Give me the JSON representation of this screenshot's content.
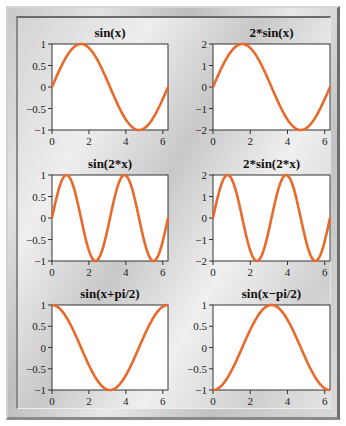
{
  "figure": {
    "layout": "3x2 subplot grid",
    "curve_color": "#e8692a"
  },
  "chart_data": [
    {
      "type": "line",
      "title": "sin(x)",
      "function": "sin(x)",
      "xlim": [
        0,
        6.283
      ],
      "ylim": [
        -1,
        1
      ],
      "xticks": [
        "0",
        "2",
        "4",
        "6"
      ],
      "yticks": [
        "1",
        "0.5",
        "0",
        "−0.5",
        "−1"
      ],
      "x": [
        0,
        0.785,
        1.571,
        2.356,
        3.142,
        3.927,
        4.712,
        5.498,
        6.283
      ],
      "y": [
        0,
        0.707,
        1,
        0.707,
        0,
        -0.707,
        -1,
        -0.707,
        0
      ]
    },
    {
      "type": "line",
      "title": "2*sin(x)",
      "function": "2*sin(x)",
      "xlim": [
        0,
        6.283
      ],
      "ylim": [
        -2,
        2
      ],
      "xticks": [
        "0",
        "2",
        "4",
        "6"
      ],
      "yticks": [
        "2",
        "1",
        "0",
        "−1",
        "−2"
      ],
      "x": [
        0,
        0.785,
        1.571,
        2.356,
        3.142,
        3.927,
        4.712,
        5.498,
        6.283
      ],
      "y": [
        0,
        1.414,
        2,
        1.414,
        0,
        -1.414,
        -2,
        -1.414,
        0
      ]
    },
    {
      "type": "line",
      "title": "sin(2*x)",
      "function": "sin(2*x)",
      "xlim": [
        0,
        6.283
      ],
      "ylim": [
        -1,
        1
      ],
      "xticks": [
        "0",
        "2",
        "4",
        "6"
      ],
      "yticks": [
        "1",
        "0.5",
        "0",
        "−0.5",
        "−1"
      ],
      "x": [
        0,
        0.785,
        1.571,
        2.356,
        3.142,
        3.927,
        4.712,
        5.498,
        6.283
      ],
      "y": [
        0,
        1,
        0,
        -1,
        0,
        1,
        0,
        -1,
        0
      ]
    },
    {
      "type": "line",
      "title": "2*sin(2*x)",
      "function": "2*sin(2*x)",
      "xlim": [
        0,
        6.283
      ],
      "ylim": [
        -2,
        2
      ],
      "xticks": [
        "0",
        "2",
        "4",
        "6"
      ],
      "yticks": [
        "2",
        "1",
        "0",
        "−1",
        "−2"
      ],
      "x": [
        0,
        0.785,
        1.571,
        2.356,
        3.142,
        3.927,
        4.712,
        5.498,
        6.283
      ],
      "y": [
        0,
        2,
        0,
        -2,
        0,
        2,
        0,
        -2,
        0
      ]
    },
    {
      "type": "line",
      "title": "sin(x+pi/2)",
      "function": "sin(x+pi/2)",
      "xlim": [
        0,
        6.283
      ],
      "ylim": [
        -1,
        1
      ],
      "xticks": [
        "0",
        "2",
        "4",
        "6"
      ],
      "yticks": [
        "1",
        "0.5",
        "0",
        "−0.5",
        "−1"
      ],
      "x": [
        0,
        0.785,
        1.571,
        2.356,
        3.142,
        3.927,
        4.712,
        5.498,
        6.283
      ],
      "y": [
        1,
        0.707,
        0,
        -0.707,
        -1,
        -0.707,
        0,
        0.707,
        1
      ]
    },
    {
      "type": "line",
      "title": "sin(x−pi/2)",
      "function": "sin(x-pi/2)",
      "xlim": [
        0,
        6.283
      ],
      "ylim": [
        -1,
        1
      ],
      "xticks": [
        "0",
        "2",
        "4",
        "6"
      ],
      "yticks": [
        "1",
        "0.5",
        "0",
        "−0.5",
        "−1"
      ],
      "x": [
        0,
        0.785,
        1.571,
        2.356,
        3.142,
        3.927,
        4.712,
        5.498,
        6.283
      ],
      "y": [
        -1,
        -0.707,
        0,
        0.707,
        1,
        0.707,
        0,
        -0.707,
        -1
      ]
    }
  ],
  "panels": [
    {
      "title": "sin(x)",
      "box": [
        52,
        44,
        168,
        130
      ]
    },
    {
      "title": "2*sin(x)",
      "box": [
        213,
        44,
        330,
        130
      ]
    },
    {
      "title": "sin(2*x)",
      "box": [
        52,
        175,
        168,
        261
      ]
    },
    {
      "title": "2*sin(2*x)",
      "box": [
        213,
        175,
        330,
        261
      ]
    },
    {
      "title": "sin(x+pi/2)",
      "box": [
        52,
        305,
        168,
        390
      ]
    },
    {
      "title": "sin(x−pi/2)",
      "box": [
        213,
        305,
        330,
        390
      ]
    }
  ]
}
